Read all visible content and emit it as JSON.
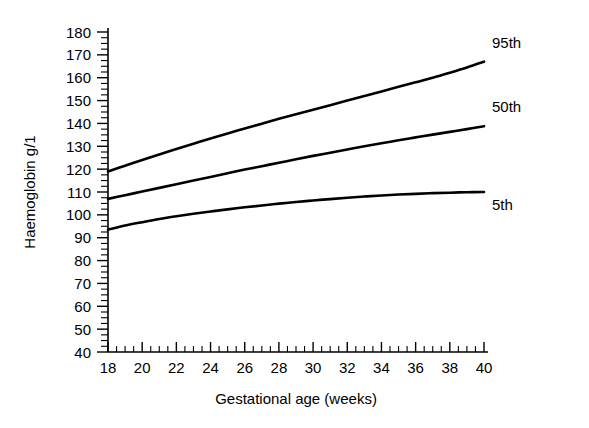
{
  "chart_data": {
    "type": "line",
    "title": "",
    "xlabel": "Gestational age (weeks)",
    "ylabel": "Haemoglobin g/1",
    "xlim": [
      18,
      40
    ],
    "ylim": [
      40,
      180
    ],
    "grid": false,
    "legend_position": "inline-right",
    "x_ticks": [
      18,
      20,
      22,
      24,
      26,
      28,
      30,
      32,
      34,
      36,
      38,
      40
    ],
    "x_tick_labels": [
      "18",
      "20",
      "22",
      "24",
      "26",
      "28",
      "30",
      "32",
      "34",
      "36",
      "38",
      "40"
    ],
    "x_minor_step": 0.5,
    "y_ticks": [
      40,
      50,
      60,
      70,
      80,
      90,
      100,
      110,
      120,
      130,
      140,
      150,
      160,
      170,
      180
    ],
    "y_tick_labels": [
      "40",
      "50",
      "60",
      "70",
      "80",
      "90",
      "100",
      "110",
      "120",
      "130",
      "140",
      "150",
      "160",
      "170",
      "180"
    ],
    "y_minor_step": 2.5,
    "x": [
      18,
      19,
      20,
      21,
      22,
      23,
      24,
      25,
      26,
      27,
      28,
      29,
      30,
      31,
      32,
      33,
      34,
      35,
      36,
      37,
      38,
      39,
      40
    ],
    "series": [
      {
        "name": "95th",
        "label": "95th",
        "color": "#000000",
        "values": [
          119.0,
          121.5,
          124.0,
          126.4,
          128.8,
          131.1,
          133.4,
          135.6,
          137.8,
          139.9,
          142.0,
          144.0,
          146.0,
          148.0,
          150.0,
          152.0,
          154.0,
          156.0,
          158.0,
          160.0,
          162.2,
          164.5,
          167.0
        ]
      },
      {
        "name": "50th",
        "label": "50th",
        "color": "#000000",
        "values": [
          107.0,
          108.6,
          110.2,
          111.8,
          113.4,
          115.0,
          116.6,
          118.2,
          119.8,
          121.3,
          122.8,
          124.3,
          125.8,
          127.2,
          128.6,
          130.0,
          131.3,
          132.6,
          133.9,
          135.1,
          136.3,
          137.5,
          138.8
        ]
      },
      {
        "name": "5th",
        "label": "5th",
        "color": "#000000",
        "values": [
          93.5,
          95.3,
          96.8,
          98.2,
          99.4,
          100.5,
          101.5,
          102.4,
          103.3,
          104.1,
          104.9,
          105.6,
          106.3,
          106.9,
          107.5,
          108.0,
          108.5,
          108.9,
          109.2,
          109.5,
          109.7,
          109.9,
          110.0
        ]
      }
    ]
  },
  "axes": {
    "y_title": "Haemoglobin g/1",
    "x_title": "Gestational age (weeks)"
  },
  "labels": {
    "p95": "95th",
    "p50": "50th",
    "p5": "5th"
  }
}
